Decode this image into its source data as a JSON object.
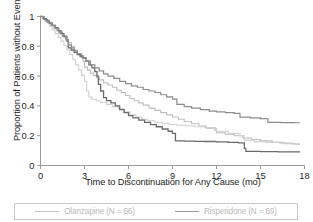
{
  "chart_data": {
    "type": "line",
    "subtype": "kaplan-meier-step",
    "title": "",
    "xlabel": "Time to Discontinuation for Any Cause (mo)",
    "ylabel": "Proportion of Patients without Event",
    "xlim": [
      0,
      18
    ],
    "ylim": [
      0,
      1
    ],
    "xticks": [
      0,
      3,
      6,
      9,
      12,
      15,
      18
    ],
    "xticklabels": [
      "0",
      "3",
      "6",
      "9",
      "12",
      "15",
      "18"
    ],
    "yticks": [
      0,
      0.2,
      0.4,
      0.6,
      0.8,
      1
    ],
    "yticklabels": [
      "0",
      "0.2",
      "0.4",
      "0.6",
      "0.8",
      "1"
    ],
    "grid": false,
    "legend_position": "below-plot",
    "series": [
      {
        "name": "Olanzapine (N = 66)",
        "color": "#bdbdbd",
        "width": 1.1,
        "points": [
          [
            0.0,
            1.0
          ],
          [
            0.15,
            0.985
          ],
          [
            0.3,
            0.97
          ],
          [
            0.5,
            0.955
          ],
          [
            0.7,
            0.94
          ],
          [
            0.9,
            0.925
          ],
          [
            1.1,
            0.905
          ],
          [
            1.3,
            0.885
          ],
          [
            1.5,
            0.865
          ],
          [
            1.7,
            0.845
          ],
          [
            1.9,
            0.825
          ],
          [
            2.1,
            0.8
          ],
          [
            2.3,
            0.775
          ],
          [
            2.5,
            0.75
          ],
          [
            2.7,
            0.73
          ],
          [
            2.9,
            0.7
          ],
          [
            3.0,
            0.66
          ],
          [
            3.2,
            0.64
          ],
          [
            3.4,
            0.62
          ],
          [
            3.6,
            0.605
          ],
          [
            3.8,
            0.59
          ],
          [
            4.0,
            0.575
          ],
          [
            4.3,
            0.555
          ],
          [
            4.6,
            0.54
          ],
          [
            4.9,
            0.525
          ],
          [
            5.2,
            0.505
          ],
          [
            5.5,
            0.49
          ],
          [
            5.8,
            0.47
          ],
          [
            6.1,
            0.45
          ],
          [
            6.4,
            0.435
          ],
          [
            6.7,
            0.42
          ],
          [
            7.0,
            0.405
          ],
          [
            7.4,
            0.385
          ],
          [
            7.8,
            0.37
          ],
          [
            8.2,
            0.355
          ],
          [
            8.6,
            0.34
          ],
          [
            9.0,
            0.325
          ],
          [
            9.4,
            0.31
          ],
          [
            9.8,
            0.295
          ],
          [
            10.3,
            0.28
          ],
          [
            10.8,
            0.265
          ],
          [
            11.3,
            0.25
          ],
          [
            11.9,
            0.235
          ],
          [
            12.0,
            0.22
          ],
          [
            12.6,
            0.21
          ],
          [
            13.2,
            0.2
          ],
          [
            13.8,
            0.185
          ],
          [
            14.4,
            0.175
          ],
          [
            15.0,
            0.165
          ],
          [
            15.8,
            0.155
          ],
          [
            16.6,
            0.147
          ],
          [
            17.4,
            0.143
          ],
          [
            17.7,
            0.143
          ]
        ]
      },
      {
        "name": "Olanzapine stratum B",
        "color": "#cfcfcf",
        "width": 1.1,
        "points": [
          [
            0.0,
            1.0
          ],
          [
            0.2,
            0.98
          ],
          [
            0.4,
            0.96
          ],
          [
            0.6,
            0.935
          ],
          [
            0.8,
            0.91
          ],
          [
            1.0,
            0.885
          ],
          [
            1.2,
            0.86
          ],
          [
            1.4,
            0.835
          ],
          [
            1.6,
            0.805
          ],
          [
            1.8,
            0.775
          ],
          [
            2.0,
            0.745
          ],
          [
            2.2,
            0.71
          ],
          [
            2.4,
            0.675
          ],
          [
            2.6,
            0.64
          ],
          [
            2.8,
            0.605
          ],
          [
            3.0,
            0.565
          ],
          [
            3.15,
            0.5
          ],
          [
            3.3,
            0.46
          ],
          [
            3.5,
            0.445
          ],
          [
            3.8,
            0.435
          ],
          [
            4.1,
            0.425
          ],
          [
            4.5,
            0.41
          ],
          [
            4.9,
            0.395
          ],
          [
            5.3,
            0.38
          ],
          [
            5.7,
            0.36
          ],
          [
            6.1,
            0.34
          ],
          [
            6.5,
            0.325
          ],
          [
            6.9,
            0.31
          ],
          [
            7.3,
            0.3
          ],
          [
            7.8,
            0.29
          ],
          [
            8.3,
            0.28
          ],
          [
            8.8,
            0.275
          ],
          [
            9.3,
            0.27
          ],
          [
            9.9,
            0.265
          ],
          [
            10.5,
            0.26
          ],
          [
            11.2,
            0.255
          ],
          [
            11.9,
            0.25
          ],
          [
            12.0,
            0.23
          ],
          [
            12.8,
            0.215
          ],
          [
            13.6,
            0.2
          ],
          [
            13.9,
            0.17
          ],
          [
            14.6,
            0.16
          ],
          [
            15.4,
            0.155
          ],
          [
            16.3,
            0.15
          ],
          [
            17.2,
            0.145
          ],
          [
            17.7,
            0.145
          ]
        ]
      },
      {
        "name": "Risperidone (N = 69)",
        "color": "#6b6b6b",
        "width": 1.3,
        "points": [
          [
            0.0,
            1.0
          ],
          [
            0.2,
            0.985
          ],
          [
            0.4,
            0.97
          ],
          [
            0.6,
            0.955
          ],
          [
            0.8,
            0.94
          ],
          [
            1.0,
            0.925
          ],
          [
            1.2,
            0.905
          ],
          [
            1.4,
            0.885
          ],
          [
            1.6,
            0.865
          ],
          [
            1.8,
            0.835
          ],
          [
            1.9,
            0.79
          ],
          [
            2.1,
            0.775
          ],
          [
            2.3,
            0.76
          ],
          [
            2.5,
            0.745
          ],
          [
            2.7,
            0.735
          ],
          [
            2.9,
            0.72
          ],
          [
            3.1,
            0.7
          ],
          [
            3.3,
            0.675
          ],
          [
            3.5,
            0.655
          ],
          [
            3.7,
            0.63
          ],
          [
            3.85,
            0.6
          ],
          [
            3.95,
            0.545
          ],
          [
            4.1,
            0.5
          ],
          [
            4.3,
            0.455
          ],
          [
            4.5,
            0.435
          ],
          [
            4.8,
            0.42
          ],
          [
            5.1,
            0.4
          ],
          [
            5.4,
            0.375
          ],
          [
            5.7,
            0.355
          ],
          [
            6.0,
            0.335
          ],
          [
            6.3,
            0.32
          ],
          [
            6.7,
            0.305
          ],
          [
            7.1,
            0.29
          ],
          [
            7.5,
            0.275
          ],
          [
            7.9,
            0.26
          ],
          [
            8.3,
            0.245
          ],
          [
            8.7,
            0.23
          ],
          [
            9.0,
            0.215
          ],
          [
            9.2,
            0.165
          ],
          [
            9.8,
            0.163
          ],
          [
            10.5,
            0.162
          ],
          [
            11.2,
            0.161
          ],
          [
            11.9,
            0.16
          ],
          [
            12.0,
            0.158
          ],
          [
            12.8,
            0.155
          ],
          [
            13.5,
            0.152
          ],
          [
            13.9,
            0.115
          ],
          [
            14.0,
            0.095
          ],
          [
            15.0,
            0.093
          ],
          [
            16.2,
            0.092
          ],
          [
            17.3,
            0.092
          ],
          [
            17.7,
            0.092
          ]
        ]
      },
      {
        "name": "Risperidone stratum B",
        "color": "#8c8c8c",
        "width": 1.2,
        "points": [
          [
            0.0,
            1.0
          ],
          [
            0.25,
            0.98
          ],
          [
            0.5,
            0.96
          ],
          [
            0.75,
            0.94
          ],
          [
            1.0,
            0.92
          ],
          [
            1.25,
            0.895
          ],
          [
            1.5,
            0.87
          ],
          [
            1.75,
            0.845
          ],
          [
            1.9,
            0.81
          ],
          [
            2.1,
            0.79
          ],
          [
            2.3,
            0.77
          ],
          [
            2.5,
            0.75
          ],
          [
            2.8,
            0.725
          ],
          [
            3.1,
            0.7
          ],
          [
            3.4,
            0.675
          ],
          [
            3.7,
            0.655
          ],
          [
            4.0,
            0.635
          ],
          [
            4.3,
            0.615
          ],
          [
            4.6,
            0.6
          ],
          [
            5.0,
            0.585
          ],
          [
            5.4,
            0.565
          ],
          [
            5.8,
            0.55
          ],
          [
            6.2,
            0.535
          ],
          [
            6.6,
            0.525
          ],
          [
            7.0,
            0.51
          ],
          [
            7.4,
            0.5
          ],
          [
            7.8,
            0.49
          ],
          [
            8.2,
            0.475
          ],
          [
            8.6,
            0.46
          ],
          [
            9.0,
            0.445
          ],
          [
            9.3,
            0.41
          ],
          [
            9.8,
            0.395
          ],
          [
            10.3,
            0.385
          ],
          [
            10.9,
            0.375
          ],
          [
            11.5,
            0.365
          ],
          [
            12.0,
            0.36
          ],
          [
            12.6,
            0.355
          ],
          [
            13.2,
            0.35
          ],
          [
            13.6,
            0.325
          ],
          [
            14.3,
            0.32
          ],
          [
            15.0,
            0.315
          ],
          [
            15.5,
            0.29
          ],
          [
            16.4,
            0.288
          ],
          [
            17.3,
            0.287
          ],
          [
            17.7,
            0.287
          ]
        ]
      }
    ]
  },
  "legend": {
    "entries": [
      {
        "label": "Olanzapine (N = 66)",
        "color": "#c6c6c6"
      },
      {
        "label": "Risperidone (N = 69)",
        "color": "#9a9a9a"
      }
    ]
  },
  "axis": {
    "color": "#9a9a9a"
  }
}
